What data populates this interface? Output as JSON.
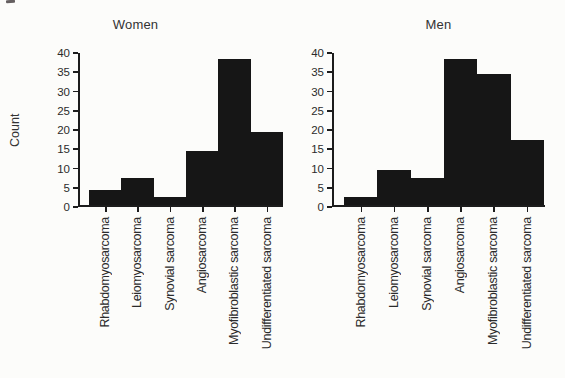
{
  "figure": {
    "background": "#fcfcfa",
    "bar_color": "#161616",
    "axis_color": "#1c1c1c",
    "text_color": "#2b2b2b"
  },
  "chart_data": [
    {
      "type": "bar",
      "title": "Women",
      "ylabel": "Count",
      "xlabel": "",
      "categories": [
        "Rhabdomyosarcoma",
        "Leiomyosarcoma",
        "Synovial sarcoma",
        "Angiosarcoma",
        "Myofibroblastic sarcoma",
        "Undifferentiated sarcoma"
      ],
      "values": [
        4,
        7,
        2,
        14,
        38,
        19
      ],
      "ylim": [
        0,
        40
      ],
      "ytick_step": 5,
      "yticks": [
        0,
        5,
        10,
        15,
        20,
        25,
        30,
        35,
        40
      ],
      "grid": false,
      "legend": null,
      "bar_gap": 0
    },
    {
      "type": "bar",
      "title": "Men",
      "ylabel": "",
      "xlabel": "",
      "categories": [
        "Rhabdomyosarcoma",
        "Leiomyosarcoma",
        "Synovial sarcoma",
        "Angiosarcoma",
        "Myofibroblastic sarcoma",
        "Undifferentiated sarcoma"
      ],
      "values": [
        2,
        9,
        7,
        38,
        34,
        17
      ],
      "ylim": [
        0,
        40
      ],
      "ytick_step": 5,
      "yticks": [
        0,
        5,
        10,
        15,
        20,
        25,
        30,
        35,
        40
      ],
      "grid": false,
      "legend": null,
      "bar_gap": 0
    }
  ]
}
